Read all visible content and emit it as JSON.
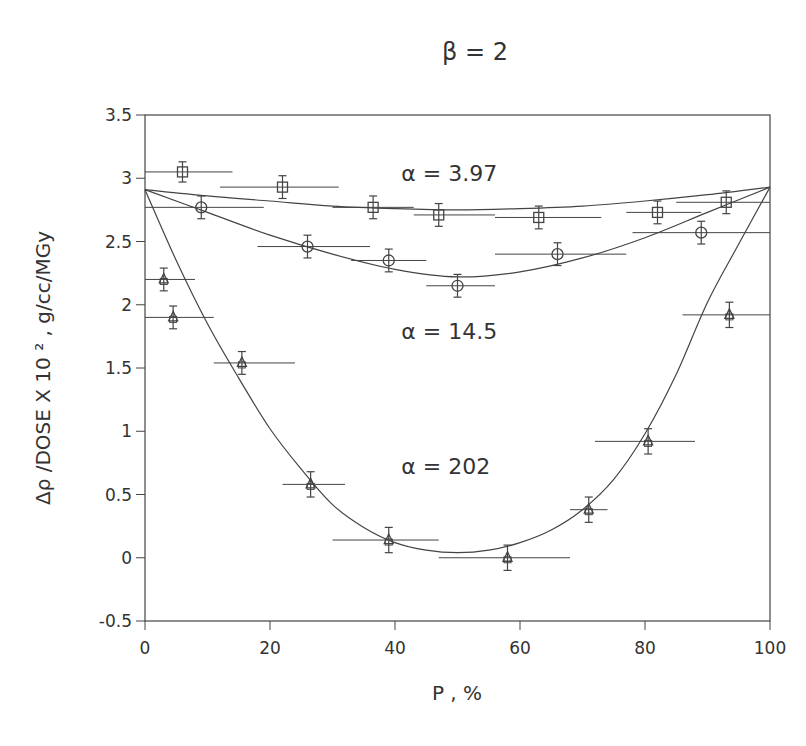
{
  "chart_data": {
    "type": "scatter",
    "title": "β = 2",
    "xlabel": "P , %",
    "ylabel": "Δρ /DOSE X 10 ² , g/cc/MGy",
    "xlim": [
      0,
      100
    ],
    "ylim": [
      -0.5,
      3.5
    ],
    "xticks": [
      0,
      20,
      40,
      60,
      80,
      100
    ],
    "xtick_labels": [
      "0",
      "20",
      "40",
      "60",
      "80",
      "100"
    ],
    "yticks": [
      -0.5,
      0,
      0.5,
      1,
      1.5,
      2,
      2.5,
      3,
      3.5
    ],
    "ytick_labels": [
      "-0.5",
      "0",
      "0.5",
      "1",
      "1.5",
      "2",
      "2.5",
      "3",
      "3.5"
    ],
    "grid": false,
    "annotations": [
      {
        "text": "α = 3.97",
        "x": 41,
        "y": 2.98
      },
      {
        "text": "α = 14.5",
        "x": 41,
        "y": 1.73
      },
      {
        "text": "α = 202",
        "x": 41,
        "y": 0.66
      }
    ],
    "series": [
      {
        "name": "α = 3.97",
        "marker": "square",
        "fit_alpha": 3.97,
        "points": [
          {
            "x": 6,
            "y": 3.05,
            "xmin": 0,
            "xmax": 14,
            "yerr": 0.08
          },
          {
            "x": 22,
            "y": 2.93,
            "xmin": 12,
            "xmax": 31,
            "yerr": 0.09
          },
          {
            "x": 36.5,
            "y": 2.77,
            "xmin": 30,
            "xmax": 43,
            "yerr": 0.09
          },
          {
            "x": 47,
            "y": 2.71,
            "xmin": 43,
            "xmax": 56,
            "yerr": 0.09
          },
          {
            "x": 63,
            "y": 2.69,
            "xmin": 56,
            "xmax": 73,
            "yerr": 0.09
          },
          {
            "x": 82,
            "y": 2.73,
            "xmin": 77,
            "xmax": 89,
            "yerr": 0.09
          },
          {
            "x": 93,
            "y": 2.81,
            "xmin": 85,
            "xmax": 100,
            "yerr": 0.09
          }
        ]
      },
      {
        "name": "α = 14.5",
        "marker": "circle",
        "fit_alpha": 14.5,
        "points": [
          {
            "x": 9,
            "y": 2.77,
            "xmin": 0,
            "xmax": 19,
            "yerr": 0.09
          },
          {
            "x": 26,
            "y": 2.46,
            "xmin": 18,
            "xmax": 36,
            "yerr": 0.09
          },
          {
            "x": 39,
            "y": 2.35,
            "xmin": 33,
            "xmax": 45,
            "yerr": 0.09
          },
          {
            "x": 50,
            "y": 2.15,
            "xmin": 45,
            "xmax": 56,
            "yerr": 0.09
          },
          {
            "x": 66,
            "y": 2.4,
            "xmin": 56,
            "xmax": 77,
            "yerr": 0.09
          },
          {
            "x": 89,
            "y": 2.57,
            "xmin": 78,
            "xmax": 100,
            "yerr": 0.09
          }
        ]
      },
      {
        "name": "α = 202",
        "marker": "triangle",
        "fit_alpha": 202,
        "points": [
          {
            "x": 3,
            "y": 2.2,
            "xmin": 0,
            "xmax": 8,
            "yerr": 0.09
          },
          {
            "x": 4.5,
            "y": 1.9,
            "xmin": 0,
            "xmax": 11,
            "yerr": 0.09
          },
          {
            "x": 15.5,
            "y": 1.54,
            "xmin": 11,
            "xmax": 24,
            "yerr": 0.09
          },
          {
            "x": 26.5,
            "y": 0.58,
            "xmin": 22,
            "xmax": 32,
            "yerr": 0.1
          },
          {
            "x": 39,
            "y": 0.14,
            "xmin": 30,
            "xmax": 47,
            "yerr": 0.1
          },
          {
            "x": 58,
            "y": 0.0,
            "xmin": 47,
            "xmax": 68,
            "yerr": 0.1
          },
          {
            "x": 71,
            "y": 0.38,
            "xmin": 68,
            "xmax": 74,
            "yerr": 0.1
          },
          {
            "x": 80.5,
            "y": 0.92,
            "xmin": 72,
            "xmax": 88,
            "yerr": 0.1
          },
          {
            "x": 93.5,
            "y": 1.92,
            "xmin": 86,
            "xmax": 100,
            "yerr": 0.1
          }
        ]
      }
    ],
    "fit_curves": [
      {
        "name": "fit α = 3.97",
        "x": [
          0,
          10,
          20,
          30,
          40,
          50,
          60,
          70,
          80,
          90,
          100
        ],
        "y": [
          2.91,
          2.86,
          2.82,
          2.78,
          2.76,
          2.75,
          2.76,
          2.78,
          2.82,
          2.87,
          2.93
        ]
      },
      {
        "name": "fit α = 14.5",
        "x": [
          0,
          10,
          20,
          30,
          40,
          50,
          60,
          70,
          80,
          90,
          100
        ],
        "y": [
          2.91,
          2.73,
          2.55,
          2.4,
          2.28,
          2.22,
          2.26,
          2.37,
          2.53,
          2.73,
          2.93
        ]
      },
      {
        "name": "fit α = 202",
        "x": [
          0,
          5,
          10,
          15,
          20,
          25,
          30,
          35,
          40,
          45,
          50,
          55,
          60,
          65,
          70,
          75,
          80,
          85,
          90,
          95,
          100
        ],
        "y": [
          2.91,
          2.35,
          1.85,
          1.42,
          1.02,
          0.7,
          0.42,
          0.24,
          0.12,
          0.06,
          0.04,
          0.06,
          0.12,
          0.22,
          0.38,
          0.62,
          0.98,
          1.45,
          2.02,
          2.48,
          2.93
        ]
      }
    ]
  }
}
